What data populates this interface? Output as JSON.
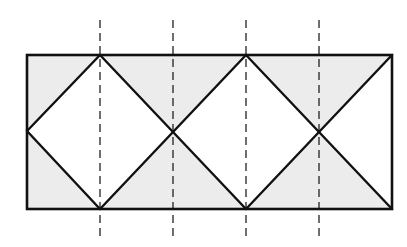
{
  "diagram": {
    "type": "geometry-tiling",
    "colors": {
      "background": "#ffffff",
      "shade": "#ececec",
      "stroke": "#111111",
      "dash": "#222222"
    },
    "rectangle": {
      "x1": 27,
      "y1": 55,
      "x2": 392,
      "y2": 209
    },
    "dashed_lines_x": [
      100,
      173,
      246,
      319
    ],
    "dashed_line_range_y": [
      20,
      240
    ],
    "shaded_triangles": [
      [
        [
          27,
          55
        ],
        [
          100,
          55
        ],
        [
          27,
          131
        ]
      ],
      [
        [
          100,
          55
        ],
        [
          246,
          55
        ],
        [
          173,
          131
        ]
      ],
      [
        [
          246,
          55
        ],
        [
          392,
          55
        ],
        [
          319,
          131
        ]
      ],
      [
        [
          27,
          131
        ],
        [
          27,
          209
        ],
        [
          100,
          209
        ]
      ],
      [
        [
          100,
          209
        ],
        [
          246,
          209
        ],
        [
          173,
          131
        ]
      ],
      [
        [
          246,
          209
        ],
        [
          392,
          209
        ],
        [
          319,
          131
        ]
      ]
    ],
    "diagonals": [
      [
        [
          27,
          131
        ],
        [
          100,
          55
        ]
      ],
      [
        [
          100,
          55
        ],
        [
          246,
          209
        ]
      ],
      [
        [
          27,
          131
        ],
        [
          100,
          209
        ]
      ],
      [
        [
          100,
          209
        ],
        [
          246,
          55
        ]
      ],
      [
        [
          246,
          55
        ],
        [
          392,
          209
        ]
      ],
      [
        [
          246,
          209
        ],
        [
          392,
          55
        ]
      ]
    ]
  }
}
